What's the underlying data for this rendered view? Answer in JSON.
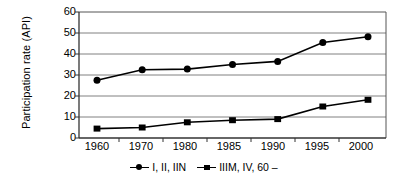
{
  "chart_data": {
    "type": "line",
    "title": "",
    "xlabel": "",
    "ylabel": "Participation rate (API)",
    "categories": [
      "1960",
      "1970",
      "1980",
      "1985",
      "1990",
      "1995",
      "2000"
    ],
    "ylim": [
      0,
      60
    ],
    "yticks": [
      0,
      10,
      20,
      30,
      40,
      50,
      60
    ],
    "grid": true,
    "legend_position": "bottom",
    "series": [
      {
        "name": "I, II, IIN",
        "marker": "circle",
        "color": "#000000",
        "values": [
          27.5,
          32.5,
          32.8,
          35.0,
          36.5,
          45.5,
          48.2
        ]
      },
      {
        "name": "IIIM, IV, 60 –",
        "marker": "square",
        "color": "#000000",
        "values": [
          4.5,
          5.0,
          7.5,
          8.5,
          9.0,
          15.0,
          18.2
        ]
      }
    ]
  },
  "axis": {
    "y_tick_labels": [
      "60",
      "50",
      "40",
      "30",
      "20",
      "10",
      "0"
    ],
    "x_tick_labels": [
      "1960",
      "1970",
      "1980",
      "1985",
      "1990",
      "1995",
      "2000"
    ],
    "y_title": "Participation rate (API)"
  },
  "legend": {
    "entries": [
      {
        "label": "I, II, IIN",
        "marker": "circle-line-marker"
      },
      {
        "label": "IIIM, IV, 60 –",
        "marker": "square-line-marker"
      }
    ]
  },
  "colors": {
    "series": "#000000",
    "grid": "#808080",
    "frame": "#555555",
    "background": "#ffffff"
  }
}
